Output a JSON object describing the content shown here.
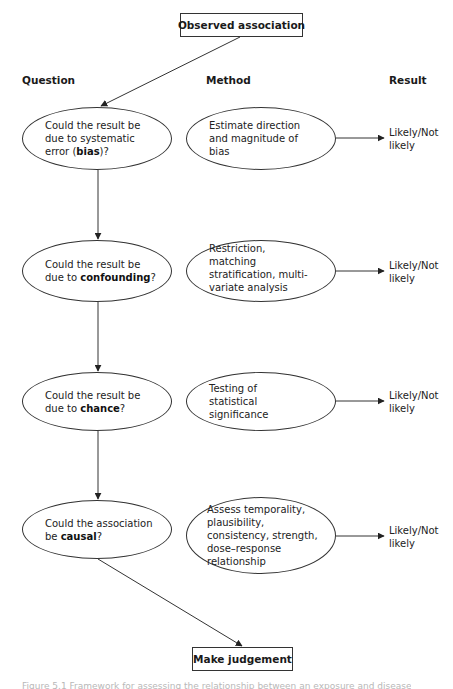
{
  "diagram": {
    "start_node": "Observed association",
    "end_node": "Make judgement",
    "column_headers": {
      "question": "Question",
      "method": "Method",
      "result": "Result"
    },
    "rows": [
      {
        "question_pre": "Could the result be due to systematic error (",
        "question_bold": "bias",
        "question_post": ")?",
        "method": "Estimate direction and magnitude of bias",
        "result_line1": "Likely/Not",
        "result_line2": "likely"
      },
      {
        "question_pre": "Could the result be due to ",
        "question_bold": "confounding",
        "question_post": "?",
        "method": "Restriction, matching stratification, multi-variate analysis",
        "result_line1": "Likely/Not",
        "result_line2": "likely"
      },
      {
        "question_pre": "Could the result be due to ",
        "question_bold": "chance",
        "question_post": "?",
        "method": "Testing of statistical significance",
        "result_line1": "Likely/Not",
        "result_line2": "likely"
      },
      {
        "question_pre": "Could the association be ",
        "question_bold": "causal",
        "question_post": "?",
        "method": "Assess temporality, plausibility, consistency, strength, dose–response relationship",
        "result_line1": "Likely/Not",
        "result_line2": "likely"
      }
    ],
    "caption_truncated": "Figure 5.1 Framework for assessing the relationship between an exposure and disease"
  },
  "colors": {
    "line": "#333333",
    "text": "#1a1a1a",
    "background": "#ffffff"
  }
}
